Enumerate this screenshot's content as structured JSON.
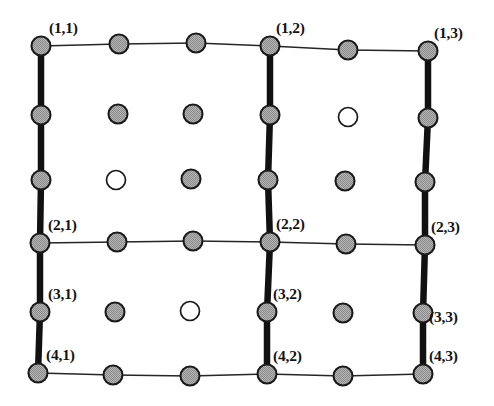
{
  "figure": {
    "type": "lattice-grid-diagram",
    "width": 494,
    "height": 406,
    "background": "#ffffff"
  },
  "style": {
    "node_fill": "#a8a8a8",
    "node_stroke": "#1a1a1a",
    "open_node_fill": "#ffffff",
    "thin_edge_color": "#262626",
    "thick_edge_color": "#111111",
    "label_color": "#141414",
    "node_radius": 9.5,
    "thin_edge_width": 1.6,
    "thick_edge_width": 6.5
  },
  "grid": {
    "rows": 6,
    "cols": 6,
    "row_labels": [
      "1",
      "",
      "",
      "2",
      "3",
      "4"
    ],
    "col_labels": [
      "1",
      "",
      "",
      "2",
      "",
      "3"
    ]
  },
  "nodes": [
    {
      "id": "r0c0",
      "x": 41,
      "y": 46,
      "open": false,
      "label": "(1,1)",
      "label_dx": 8,
      "label_dy": -26
    },
    {
      "id": "r0c1",
      "x": 119,
      "y": 44,
      "open": false,
      "label": null
    },
    {
      "id": "r0c2",
      "x": 196,
      "y": 43,
      "open": false,
      "label": null
    },
    {
      "id": "r0c3",
      "x": 270,
      "y": 46,
      "open": false,
      "label": "(1,2)",
      "label_dx": 6,
      "label_dy": -26
    },
    {
      "id": "r0c4",
      "x": 348,
      "y": 50,
      "open": false,
      "label": null
    },
    {
      "id": "r0c5",
      "x": 428,
      "y": 51,
      "open": false,
      "label": "(1,3)",
      "label_dx": 6,
      "label_dy": -26
    },
    {
      "id": "r1c0",
      "x": 41,
      "y": 115,
      "open": false,
      "label": null
    },
    {
      "id": "r1c1",
      "x": 118,
      "y": 114,
      "open": false,
      "label": null
    },
    {
      "id": "r1c2",
      "x": 193,
      "y": 114,
      "open": false,
      "label": null
    },
    {
      "id": "r1c3",
      "x": 270,
      "y": 115,
      "open": false,
      "label": null
    },
    {
      "id": "r1c4",
      "x": 348,
      "y": 117,
      "open": true,
      "label": null
    },
    {
      "id": "r1c5",
      "x": 428,
      "y": 118,
      "open": false,
      "label": null
    },
    {
      "id": "r2c0",
      "x": 41,
      "y": 180,
      "open": false,
      "label": null
    },
    {
      "id": "r2c1",
      "x": 116,
      "y": 180,
      "open": true,
      "label": null
    },
    {
      "id": "r2c2",
      "x": 191,
      "y": 179,
      "open": false,
      "label": null
    },
    {
      "id": "r2c3",
      "x": 268,
      "y": 180,
      "open": false,
      "label": null
    },
    {
      "id": "r2c4",
      "x": 345,
      "y": 181,
      "open": false,
      "label": null
    },
    {
      "id": "r2c5",
      "x": 425,
      "y": 182,
      "open": false,
      "label": null
    },
    {
      "id": "r3c0",
      "x": 40,
      "y": 243,
      "open": false,
      "label": "(2,1)",
      "label_dx": 8,
      "label_dy": -26
    },
    {
      "id": "r3c1",
      "x": 117,
      "y": 242,
      "open": false,
      "label": null
    },
    {
      "id": "r3c2",
      "x": 193,
      "y": 241,
      "open": false,
      "label": null
    },
    {
      "id": "r3c3",
      "x": 270,
      "y": 242,
      "open": false,
      "label": "(2,2)",
      "label_dx": 6,
      "label_dy": -26
    },
    {
      "id": "r3c4",
      "x": 346,
      "y": 244,
      "open": false,
      "label": null
    },
    {
      "id": "r3c5",
      "x": 425,
      "y": 245,
      "open": false,
      "label": "(2,3)",
      "label_dx": 6,
      "label_dy": -26
    },
    {
      "id": "r4c0",
      "x": 40,
      "y": 312,
      "open": false,
      "label": "(3,1)",
      "label_dx": 8,
      "label_dy": -26
    },
    {
      "id": "r4c1",
      "x": 115,
      "y": 312,
      "open": false,
      "label": null
    },
    {
      "id": "r4c2",
      "x": 190,
      "y": 311,
      "open": true,
      "label": null
    },
    {
      "id": "r4c3",
      "x": 267,
      "y": 312,
      "open": false,
      "label": "(3,2)",
      "label_dx": 6,
      "label_dy": -26
    },
    {
      "id": "r4c4",
      "x": 343,
      "y": 313,
      "open": false,
      "label": null
    },
    {
      "id": "r4c5",
      "x": 423,
      "y": 313,
      "open": false,
      "label": "(3,3)",
      "label_dx": 6,
      "label_dy": -4
    },
    {
      "id": "r5c0",
      "x": 38,
      "y": 373,
      "open": false,
      "label": "(4,1)",
      "label_dx": 8,
      "label_dy": -26
    },
    {
      "id": "r5c1",
      "x": 113,
      "y": 375,
      "open": false,
      "label": null
    },
    {
      "id": "r5c2",
      "x": 190,
      "y": 376,
      "open": false,
      "label": null
    },
    {
      "id": "r5c3",
      "x": 267,
      "y": 374,
      "open": false,
      "label": "(4,2)",
      "label_dx": 6,
      "label_dy": -26
    },
    {
      "id": "r5c4",
      "x": 343,
      "y": 376,
      "open": false,
      "label": null
    },
    {
      "id": "r5c5",
      "x": 423,
      "y": 374,
      "open": false,
      "label": "(4,3)",
      "label_dx": 6,
      "label_dy": -26
    }
  ],
  "edges": {
    "thin": [
      [
        "r0c0",
        "r0c1"
      ],
      [
        "r0c1",
        "r0c2"
      ],
      [
        "r0c2",
        "r0c3"
      ],
      [
        "r0c3",
        "r0c4"
      ],
      [
        "r0c4",
        "r0c5"
      ],
      [
        "r3c0",
        "r3c1"
      ],
      [
        "r3c1",
        "r3c2"
      ],
      [
        "r3c2",
        "r3c3"
      ],
      [
        "r3c3",
        "r3c4"
      ],
      [
        "r3c4",
        "r3c5"
      ],
      [
        "r5c0",
        "r5c1"
      ],
      [
        "r5c1",
        "r5c2"
      ],
      [
        "r5c2",
        "r5c3"
      ],
      [
        "r5c3",
        "r5c4"
      ],
      [
        "r5c4",
        "r5c5"
      ]
    ],
    "thick": [
      [
        "r0c0",
        "r1c0"
      ],
      [
        "r1c0",
        "r2c0"
      ],
      [
        "r2c0",
        "r3c0"
      ],
      [
        "r3c0",
        "r4c0"
      ],
      [
        "r4c0",
        "r5c0"
      ],
      [
        "r0c3",
        "r1c3"
      ],
      [
        "r1c3",
        "r2c3"
      ],
      [
        "r2c3",
        "r3c3"
      ],
      [
        "r3c3",
        "r4c3"
      ],
      [
        "r4c3",
        "r5c3"
      ],
      [
        "r0c5",
        "r1c5"
      ],
      [
        "r1c5",
        "r2c5"
      ],
      [
        "r2c5",
        "r3c5"
      ],
      [
        "r3c5",
        "r4c5"
      ],
      [
        "r4c5",
        "r5c5"
      ]
    ]
  },
  "legend": {
    "filled_meaning": "shaded node",
    "open_meaning": "open node"
  }
}
